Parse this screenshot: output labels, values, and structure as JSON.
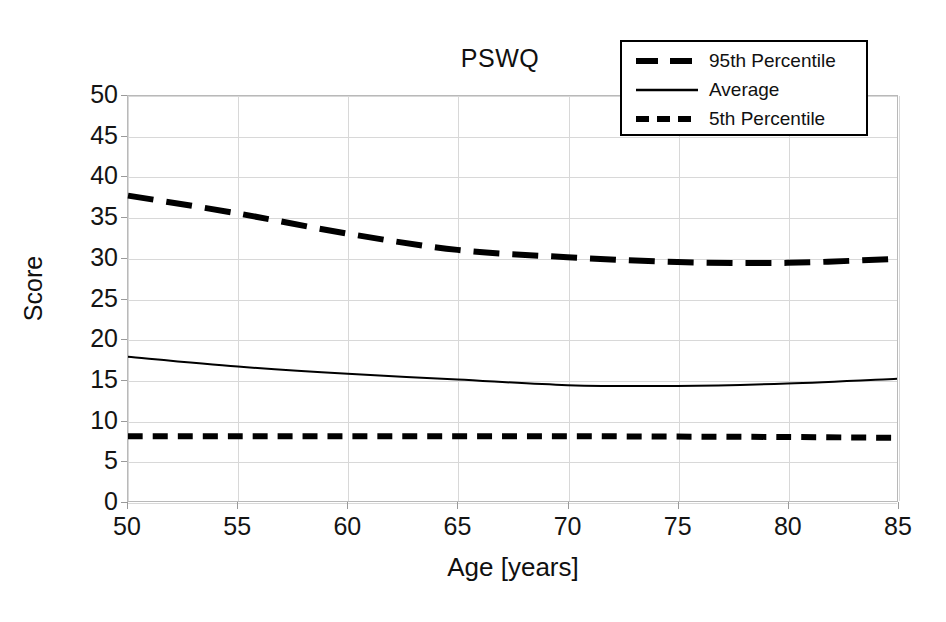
{
  "chart_data": {
    "type": "line",
    "title": "PSWQ",
    "xlabel": "Age [years]",
    "ylabel": "Score",
    "xlim": [
      50,
      85
    ],
    "ylim": [
      0,
      50
    ],
    "xticks": [
      50,
      55,
      60,
      65,
      70,
      75,
      80,
      85
    ],
    "yticks": [
      0,
      5,
      10,
      15,
      20,
      25,
      30,
      35,
      40,
      45,
      50
    ],
    "grid": true,
    "legend_position": "top-right",
    "x": [
      50,
      55,
      60,
      65,
      70,
      75,
      80,
      85
    ],
    "series": [
      {
        "name": "95th Percentile",
        "style": "long-dash",
        "color": "#000000",
        "width": 6,
        "values": [
          37.7,
          35.5,
          33.0,
          31.0,
          30.1,
          29.5,
          29.4,
          29.9
        ]
      },
      {
        "name": "Average",
        "style": "solid",
        "color": "#000000",
        "width": 2,
        "values": [
          17.8,
          16.6,
          15.7,
          15.0,
          14.3,
          14.2,
          14.5,
          15.1
        ]
      },
      {
        "name": "5th Percentile",
        "style": "short-dash",
        "color": "#000000",
        "width": 6,
        "values": [
          8.0,
          8.0,
          8.0,
          8.0,
          8.0,
          7.95,
          7.9,
          7.8
        ]
      }
    ]
  },
  "legend": {
    "items": [
      {
        "label": "95th Percentile"
      },
      {
        "label": "Average"
      },
      {
        "label": "5th Percentile"
      }
    ]
  },
  "axes": {
    "y_tick_labels": [
      "50",
      "45",
      "40",
      "35",
      "30",
      "25",
      "20",
      "15",
      "10",
      "5",
      "0"
    ],
    "x_tick_labels": [
      "50",
      "55",
      "60",
      "65",
      "70",
      "75",
      "80",
      "85"
    ],
    "ylabel": "Score",
    "xlabel": "Age [years]"
  },
  "colors": {
    "line": "#000000",
    "grid": "#d8d8d8",
    "frame": "#b9b9b9",
    "background": "#ffffff"
  }
}
